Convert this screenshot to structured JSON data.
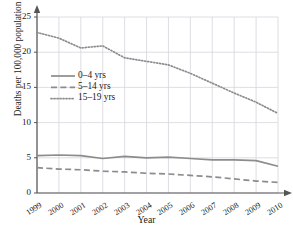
{
  "chart_data": {
    "type": "line",
    "title": "",
    "xlabel": "Year",
    "ylabel": "Deaths per 100,000 population",
    "categories": [
      "1999",
      "2000",
      "2001",
      "2002",
      "2003",
      "2004",
      "2005",
      "2006",
      "2007",
      "2008",
      "2009",
      "2010"
    ],
    "x": [
      1999,
      2000,
      2001,
      2002,
      2003,
      2004,
      2005,
      2006,
      2007,
      2008,
      2009,
      2010
    ],
    "xlim": [
      1999,
      2010
    ],
    "ylim": [
      0,
      25
    ],
    "yticks": [
      0,
      5,
      10,
      15,
      20,
      25
    ],
    "xticks": [
      "1999",
      "2000",
      "2001",
      "2002",
      "2003",
      "2004",
      "2005",
      "2006",
      "2007",
      "2008",
      "2009",
      "2010"
    ],
    "grid": true,
    "legend_position": "upper-left",
    "series": [
      {
        "name": "0–4 yrs",
        "style": "solid",
        "color": "#8c8c8c",
        "values": [
          5.3,
          5.4,
          5.3,
          4.9,
          5.2,
          5.0,
          5.1,
          4.9,
          4.7,
          4.7,
          4.6,
          3.8
        ]
      },
      {
        "name": "5–14 yrs",
        "style": "dashed",
        "color": "#8c8c8c",
        "values": [
          3.6,
          3.4,
          3.3,
          3.1,
          3.0,
          2.8,
          2.7,
          2.5,
          2.3,
          2.0,
          1.7,
          1.5
        ]
      },
      {
        "name": "15–19 yrs",
        "style": "dotted",
        "color": "#8c8c8c",
        "values": [
          22.8,
          22.0,
          20.6,
          20.9,
          19.2,
          18.7,
          18.2,
          17.0,
          15.6,
          14.2,
          12.9,
          11.3
        ]
      }
    ]
  },
  "axes": {
    "ylabel": "Deaths per 100,000 population",
    "xlabel": "Year",
    "yticks": [
      "0",
      "5",
      "10",
      "15",
      "20",
      "25"
    ],
    "xticks": [
      "1999",
      "2000",
      "2001",
      "2002",
      "2003",
      "2004",
      "2005",
      "2006",
      "2007",
      "2008",
      "2009",
      "2010"
    ]
  },
  "legend": {
    "items": [
      {
        "label": "0–4 yrs",
        "style": "solid"
      },
      {
        "label": "5–14 yrs",
        "style": "dashed"
      },
      {
        "label": "15–19 yrs",
        "style": "dotted"
      }
    ]
  },
  "colors": {
    "line": "#8c8c8c",
    "axis": "#555555",
    "grid": "#d6d6dd",
    "text": "#1a1a1a",
    "background": "#ffffff"
  }
}
